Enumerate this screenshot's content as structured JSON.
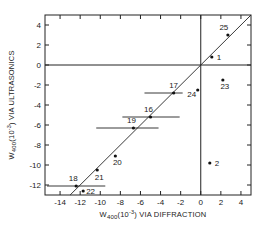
{
  "chart_data": {
    "type": "scatter",
    "title": "",
    "xlabel": {
      "base": "W",
      "sub": "400",
      "paren": "(10",
      "sup": "-3",
      "rest": ") VIA DIFFRACTION"
    },
    "ylabel": {
      "base": "W",
      "sub": "400",
      "paren": "(10",
      "sup": "-3",
      "rest": ") VIA ULTRASONICS"
    },
    "xlim": [
      -15.5,
      5
    ],
    "ylim": [
      -13,
      5
    ],
    "xticks": [
      -14,
      -12,
      -10,
      -8,
      -6,
      -4,
      -2,
      0,
      2,
      4
    ],
    "yticks": [
      -12,
      -10,
      -8,
      -6,
      -4,
      -2,
      0,
      2,
      4
    ],
    "reference_lines": {
      "x_zero": true,
      "y_zero": true,
      "diagonal_y_equals_x": true
    },
    "grid": false,
    "points": [
      {
        "label": "25",
        "x": 2.7,
        "y": 3.0
      },
      {
        "label": "1",
        "x": 1.1,
        "y": 0.8
      },
      {
        "label": "23",
        "x": 2.2,
        "y": -1.5
      },
      {
        "label": "24",
        "x": -0.3,
        "y": -2.5
      },
      {
        "label": "17",
        "x": -2.7,
        "y": -2.8,
        "xerr": [
          -5.6,
          -1.8
        ]
      },
      {
        "label": "16",
        "x": -5.0,
        "y": -5.2,
        "xerr": [
          -7.8,
          -2.1
        ]
      },
      {
        "label": "19",
        "x": -6.7,
        "y": -6.3,
        "xerr": [
          -10.4,
          -4.2
        ]
      },
      {
        "label": "20",
        "x": -8.5,
        "y": -9.1
      },
      {
        "label": "21",
        "x": -10.3,
        "y": -10.5
      },
      {
        "label": "18",
        "x": -12.4,
        "y": -12.1,
        "xerr": [
          -15.3,
          -9.5
        ]
      },
      {
        "label": "22",
        "x": -11.7,
        "y": -12.6
      },
      {
        "label": "2",
        "x": 0.9,
        "y": -9.8
      }
    ]
  }
}
